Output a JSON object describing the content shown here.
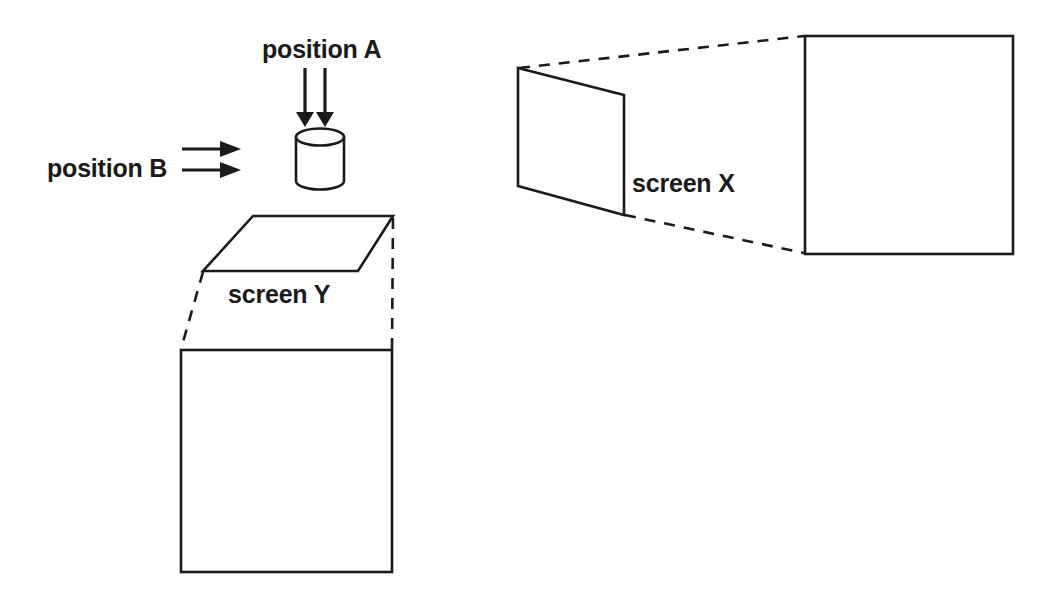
{
  "figure": {
    "type": "line-diagram",
    "background_color": "#ffffff",
    "line_color": "#1a1a1a"
  },
  "labels": {
    "position_a": "position A",
    "position_b": "position B",
    "screen_y": "screen Y",
    "screen_x": "screen X"
  },
  "left_group": {
    "name": "position-a-b-screen-y-group",
    "arrows_a": {
      "name": "position-a-arrows",
      "direction": "down",
      "count": 2,
      "lines": [
        {
          "x1": 305,
          "y1": 68,
          "x2": 305,
          "y2": 116
        },
        {
          "x1": 325,
          "y1": 68,
          "x2": 325,
          "y2": 116
        }
      ],
      "heads": [
        {
          "points": "296,112 314,112 305,127"
        },
        {
          "points": "316,112 334,112 325,127"
        }
      ]
    },
    "arrows_b": {
      "name": "position-b-arrows",
      "direction": "right",
      "count": 2,
      "lines": [
        {
          "x1": 182,
          "y1": 149,
          "x2": 223,
          "y2": 149
        },
        {
          "x1": 182,
          "y1": 170,
          "x2": 223,
          "y2": 170
        }
      ],
      "heads": [
        {
          "points": "220,141 220,157 241,149"
        },
        {
          "points": "220,162 220,178 241,170"
        }
      ]
    },
    "cylinder": {
      "name": "cylinder-object",
      "cx": 320,
      "top_cy": 137,
      "bottom_cy": 181,
      "rx": 24,
      "ry": 8.5,
      "body_left": 296,
      "body_right": 344,
      "body_top": 137,
      "body_bottom": 181
    },
    "parallelogram": {
      "name": "screen-y-parallelogram",
      "points": "253,216 393,216 358,271 203,271"
    },
    "square": {
      "name": "screen-y-projection-square",
      "x": 181,
      "y": 350,
      "width": 211,
      "height": 222
    },
    "connectors": [
      {
        "name": "screen-y-connector-left",
        "x1": 203,
        "y1": 272,
        "x2": 181,
        "y2": 349
      },
      {
        "name": "screen-y-connector-right",
        "x1": 393,
        "y1": 218,
        "x2": 392,
        "y2": 349
      }
    ]
  },
  "right_group": {
    "name": "screen-x-group",
    "trapezoid": {
      "name": "screen-x-trapezoid",
      "points": "518,68 624,95 624,215 518,186"
    },
    "square": {
      "name": "screen-x-projection-square",
      "x": 805,
      "y": 36,
      "width": 208,
      "height": 218
    },
    "connectors": [
      {
        "name": "screen-x-connector-top",
        "x1": 519,
        "y1": 68,
        "x2": 804,
        "y2": 36
      },
      {
        "name": "screen-x-connector-bottom",
        "x1": 625,
        "y1": 215,
        "x2": 804,
        "y2": 253
      }
    ]
  },
  "text_positions": {
    "position_a": {
      "x": 262,
      "y": 58
    },
    "position_b": {
      "x": 47,
      "y": 177
    },
    "screen_y": {
      "x": 228,
      "y": 303
    },
    "screen_x": {
      "x": 632,
      "y": 192
    }
  }
}
